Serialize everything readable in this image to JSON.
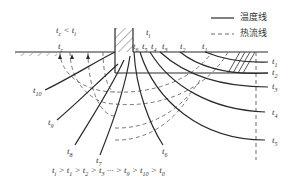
{
  "diagram": {
    "legend": {
      "solid_label": "温度线",
      "dashed_label": "热流线"
    },
    "labels": {
      "t_c_vs_t_i": "t_c < t_i",
      "t_i": "t_i",
      "t_c": "t_c",
      "top_temps": [
        "t_6",
        "t_5",
        "t_4",
        "t_3",
        "t_2",
        "t_1"
      ],
      "right_temps": [
        "t_1",
        "t_2",
        "t_3",
        "t_4",
        "t_5"
      ],
      "lower_temps": [
        "t_10",
        "t_9",
        "t_8",
        "t_7",
        "t_6"
      ]
    },
    "inequality": "t_i > t_1 > t_2 > t_3 ··· > t_9 > t_10 > t_0",
    "colors": {
      "line": "#2a2a2a",
      "dash": "#6a6a6a",
      "text": "#333333"
    }
  }
}
